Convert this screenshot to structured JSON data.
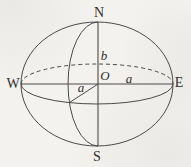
{
  "figure": {
    "labels": {
      "north": "N",
      "south": "S",
      "west": "W",
      "east": "E",
      "center": "O",
      "polar_semi_axis": "b",
      "equatorial_radius_east": "a",
      "equatorial_radius_front": "a"
    },
    "colors": {
      "stroke": "#4a4a4a",
      "background": "#f4f2ef",
      "text": "#2f2f2f"
    }
  }
}
